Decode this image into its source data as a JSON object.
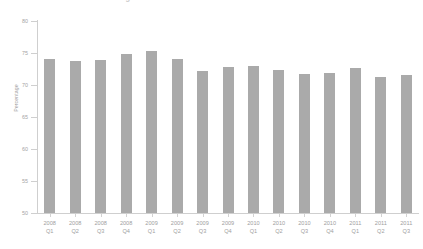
{
  "chart_data": {
    "type": "bar",
    "title": "Percentage of Households with Internet Access in the United States",
    "xlabel": "",
    "ylabel": "Percentage",
    "ylim": [
      50,
      80
    ],
    "yticks": [
      50,
      55,
      60,
      65,
      70,
      75,
      80
    ],
    "grid": false,
    "legend": null,
    "bar_color": "#aaaaaa",
    "categories": [
      "2008\nQ1",
      "2008\nQ2",
      "2008\nQ3",
      "2008\nQ4",
      "2009\nQ1",
      "2009\nQ2",
      "2009\nQ3",
      "2009\nQ4",
      "2010\nQ1",
      "2010\nQ2",
      "2010\nQ3",
      "2010\nQ4",
      "2011\nQ1",
      "2011\nQ2",
      "2011\nQ3"
    ],
    "values": [
      74.0,
      73.8,
      73.9,
      74.8,
      75.3,
      74.0,
      72.2,
      72.8,
      72.9,
      72.4,
      71.7,
      71.9,
      72.6,
      71.3,
      71.6
    ]
  },
  "axis": {
    "y_title": "Percentage",
    "tick_labels": [
      "80",
      "75",
      "70",
      "65",
      "60",
      "55",
      "50"
    ]
  }
}
